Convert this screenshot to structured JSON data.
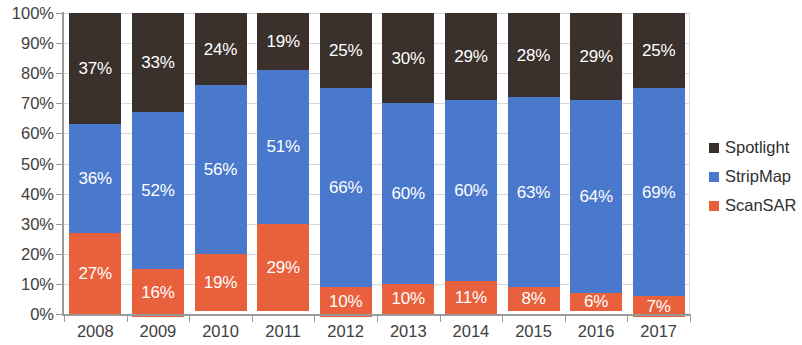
{
  "chart_data": {
    "type": "bar",
    "subtype": "stacked-bar-100-percent",
    "title": "",
    "subtitle": "",
    "xlabel": "",
    "ylabel": "",
    "categories": [
      "2008",
      "2009",
      "2010",
      "2011",
      "2012",
      "2013",
      "2014",
      "2015",
      "2016",
      "2017"
    ],
    "series": [
      {
        "name": "ScanSAR",
        "color": "#e8603c",
        "values": [
          27,
          16,
          19,
          29,
          10,
          10,
          11,
          8,
          6,
          7
        ],
        "labels": [
          "27%",
          "16%",
          "19%",
          "29%",
          "10%",
          "10%",
          "11%",
          "8%",
          "6%",
          "7%"
        ]
      },
      {
        "name": "StripMap",
        "color": "#4a78cc",
        "values": [
          36,
          52,
          56,
          51,
          66,
          60,
          60,
          63,
          64,
          69
        ],
        "labels": [
          "36%",
          "52%",
          "56%",
          "51%",
          "66%",
          "60%",
          "60%",
          "63%",
          "64%",
          "69%"
        ]
      },
      {
        "name": "Spotlight",
        "color": "#3a302c",
        "values": [
          37,
          33,
          24,
          19,
          25,
          30,
          29,
          28,
          29,
          25
        ],
        "labels": [
          "37%",
          "33%",
          "24%",
          "19%",
          "25%",
          "30%",
          "29%",
          "28%",
          "29%",
          "25%"
        ]
      }
    ],
    "stack_order_bottom_to_top": [
      "ScanSAR",
      "StripMap",
      "Spotlight"
    ],
    "ylim": [
      0,
      100
    ],
    "yticks": [
      0,
      10,
      20,
      30,
      40,
      50,
      60,
      70,
      80,
      90,
      100
    ],
    "ytick_labels": [
      "0%",
      "10%",
      "20%",
      "30%",
      "40%",
      "50%",
      "60%",
      "70%",
      "80%",
      "90%",
      "100%"
    ],
    "grid": true,
    "grid_axis": "y",
    "legend_position": "right",
    "legend_entries": [
      {
        "label": "Spotlight",
        "color": "#3a302c"
      },
      {
        "label": "StripMap",
        "color": "#4a78cc"
      },
      {
        "label": "ScanSAR",
        "color": "#e8603c"
      }
    ],
    "annotations": [],
    "value_labels_shown": true,
    "value_label_color": "#ffffff"
  }
}
